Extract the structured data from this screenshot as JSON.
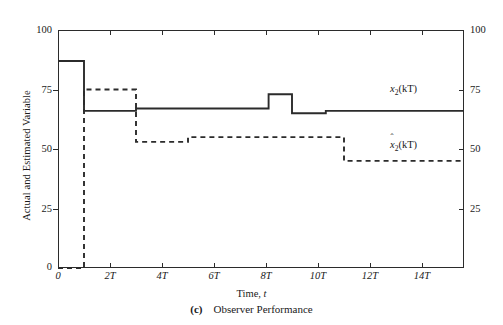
{
  "figure": {
    "caption_index": "(c)",
    "caption_text": "Observer Performance",
    "ylabel": "Actual and Estimated Variable",
    "xlabel_rom": "Time, ",
    "xlabel_ital": "t"
  },
  "axes": {
    "y_ticks_left": [
      "100",
      "75",
      "50",
      "25",
      "0"
    ],
    "y_ticks_right": [
      "100",
      "75",
      "50",
      "25",
      ""
    ],
    "x_ticks": [
      "0",
      "2T",
      "4T",
      "6T",
      "8T",
      "10T",
      "12T",
      "14T"
    ]
  },
  "legend": {
    "actual_base": "x",
    "actual_sub": "2",
    "actual_arg": "(kT)",
    "estimated_base": "x",
    "estimated_hat": "ˆ",
    "estimated_sub": "2",
    "estimated_arg": "(kT)"
  },
  "chart_data": {
    "type": "line",
    "xlabel": "Time, t",
    "ylabel": "Actual and Estimated Variable",
    "xlim": [
      0,
      15.6
    ],
    "ylim": [
      0,
      100
    ],
    "x_tick_values": [
      0,
      2,
      4,
      6,
      8,
      10,
      12,
      14
    ],
    "x_tick_labels": [
      "0",
      "2T",
      "4T",
      "6T",
      "8T",
      "10T",
      "12T",
      "14T"
    ],
    "y_tick_values": [
      0,
      25,
      50,
      75,
      100
    ],
    "y_tick_labels": [
      "100",
      "75",
      "50",
      "25",
      "0"
    ],
    "grid": false,
    "legend_position": "inline-right",
    "series": [
      {
        "name": "x_2(kT)",
        "style": "solid",
        "color": "#2b2b2b",
        "description": "Actual state variable, piecewise-constant step trace",
        "steps": [
          {
            "t_start": 0.0,
            "t_end": 1.0,
            "value": 87
          },
          {
            "t_start": 1.0,
            "t_end": 3.0,
            "value": 66
          },
          {
            "t_start": 3.0,
            "t_end": 8.1,
            "value": 67
          },
          {
            "t_start": 8.1,
            "t_end": 9.0,
            "value": 73
          },
          {
            "t_start": 9.0,
            "t_end": 10.3,
            "value": 65
          },
          {
            "t_start": 10.3,
            "t_end": 15.6,
            "value": 66
          }
        ]
      },
      {
        "name": "xhat_2(kT)",
        "style": "dashed",
        "color": "#2b2b2b",
        "description": "Estimated state variable, starts at 0 and converges toward actual",
        "steps": [
          {
            "t_start": 0.0,
            "t_end": 1.0,
            "value": 0
          },
          {
            "t_start": 1.0,
            "t_end": 2.0,
            "value": 75
          },
          {
            "t_start": 2.0,
            "t_end": 3.0,
            "value": 75
          },
          {
            "t_start": 3.0,
            "t_end": 5.0,
            "value": 53
          },
          {
            "t_start": 5.0,
            "t_end": 11.0,
            "value": 55
          },
          {
            "t_start": 11.0,
            "t_end": 12.3,
            "value": 45
          },
          {
            "t_start": 12.3,
            "t_end": 15.6,
            "value": 45
          }
        ]
      }
    ]
  }
}
